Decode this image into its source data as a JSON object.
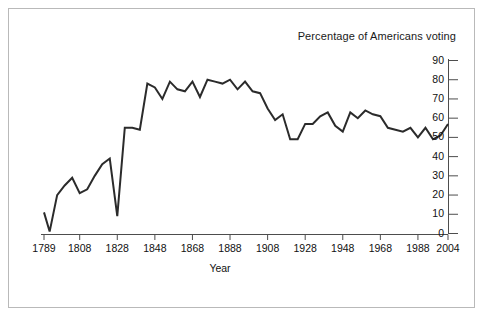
{
  "figure": {
    "title": "Percentage of Americans voting",
    "background_color": "#ffffff",
    "border_color": "#b9b9b9",
    "line_color": "#2b2b2b",
    "axis_color": "#4d4d4d"
  },
  "chart_data": {
    "type": "line",
    "title": "Percentage of Americans voting",
    "xlabel": "Year",
    "ylabel": "",
    "xlim": [
      1789,
      2004
    ],
    "ylim": [
      0,
      90
    ],
    "grid": false,
    "legend": "none",
    "x_tick_labels": [
      "1789",
      "1808",
      "1828",
      "1848",
      "1868",
      "1888",
      "1908",
      "1928",
      "1948",
      "1968",
      "1988",
      "2004"
    ],
    "x_ticks": [
      1789,
      1808,
      1828,
      1848,
      1868,
      1888,
      1908,
      1928,
      1948,
      1968,
      1988,
      2004
    ],
    "y_tick_labels": [
      "0",
      "10",
      "20",
      "30",
      "40",
      "50",
      "60",
      "70",
      "80",
      "90"
    ],
    "y_ticks": [
      0,
      10,
      20,
      30,
      40,
      50,
      60,
      70,
      80,
      90
    ],
    "series": [
      {
        "name": "Percentage of Americans voting",
        "x": [
          1789,
          1792,
          1796,
          1800,
          1804,
          1808,
          1812,
          1816,
          1820,
          1824,
          1828,
          1832,
          1836,
          1840,
          1844,
          1848,
          1852,
          1856,
          1860,
          1864,
          1868,
          1872,
          1876,
          1880,
          1884,
          1888,
          1892,
          1896,
          1900,
          1904,
          1908,
          1912,
          1916,
          1920,
          1924,
          1928,
          1932,
          1936,
          1940,
          1944,
          1948,
          1952,
          1956,
          1960,
          1964,
          1968,
          1972,
          1976,
          1980,
          1984,
          1988,
          1992,
          1996,
          2000,
          2004
        ],
        "values": [
          11,
          1,
          20,
          25,
          29,
          21,
          23,
          30,
          36,
          39,
          9,
          55,
          55,
          54,
          78,
          76,
          70,
          79,
          75,
          74,
          79,
          71,
          80,
          79,
          78,
          80,
          75,
          79,
          74,
          73,
          65,
          59,
          62,
          49,
          49,
          57,
          57,
          61,
          63,
          56,
          53,
          63,
          60,
          64,
          62,
          61,
          55,
          54,
          53,
          55,
          50,
          55,
          49,
          51,
          57
        ]
      }
    ]
  },
  "axes": {
    "x_title": "Year"
  }
}
